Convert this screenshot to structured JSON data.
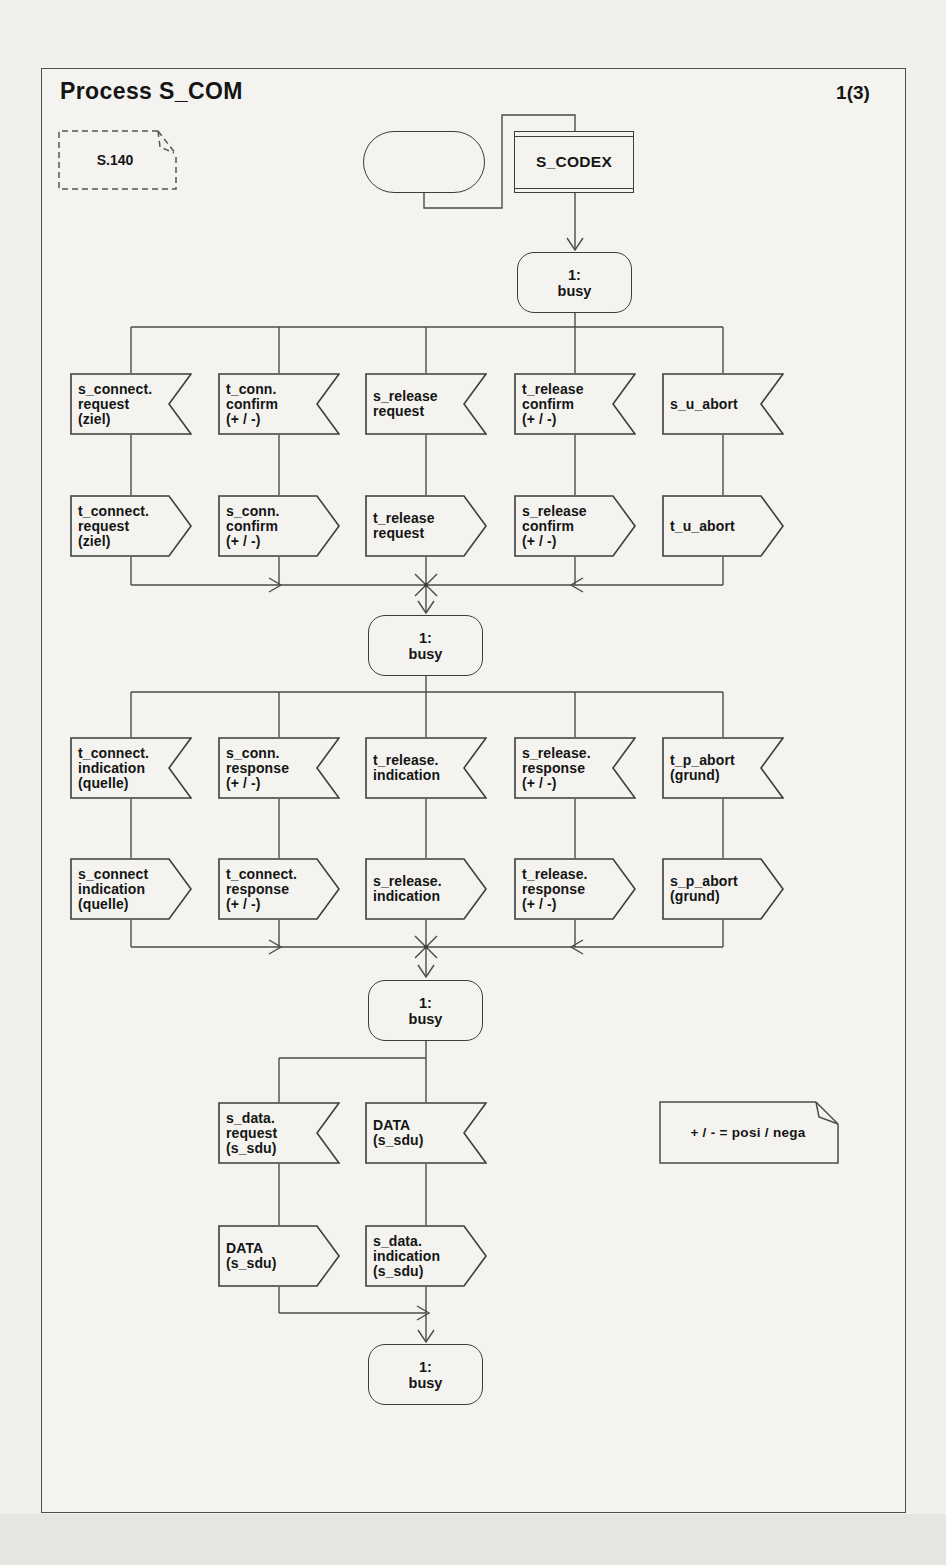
{
  "page": {
    "title": "Process S_COM",
    "page_number": "1(3)"
  },
  "comment_ref": {
    "label": "S.140"
  },
  "procedure": {
    "label": "S_CODEX"
  },
  "state": {
    "line1": "1:",
    "line2": "busy"
  },
  "note": {
    "text": "+ / - = posi / nega"
  },
  "tier1": {
    "inputs": [
      {
        "lines": [
          "s_connect.",
          "request",
          "(ziel)"
        ]
      },
      {
        "lines": [
          "t_conn.",
          "confirm",
          "(+ / -)"
        ]
      },
      {
        "lines": [
          "s_release",
          "request"
        ]
      },
      {
        "lines": [
          "t_release",
          "confirm",
          "(+ / -)"
        ]
      },
      {
        "lines": [
          "s_u_abort"
        ]
      }
    ],
    "outputs": [
      {
        "lines": [
          "t_connect.",
          "request",
          "(ziel)"
        ]
      },
      {
        "lines": [
          "s_conn.",
          "confirm",
          "(+ / -)"
        ]
      },
      {
        "lines": [
          "t_release",
          "request"
        ]
      },
      {
        "lines": [
          "s_release",
          "confirm",
          "(+ / -)"
        ]
      },
      {
        "lines": [
          "t_u_abort"
        ]
      }
    ]
  },
  "tier2": {
    "inputs": [
      {
        "lines": [
          "t_connect.",
          "indication",
          "(quelle)"
        ]
      },
      {
        "lines": [
          "s_conn.",
          "response",
          "(+ / -)"
        ]
      },
      {
        "lines": [
          "t_release.",
          "indication"
        ]
      },
      {
        "lines": [
          "s_release.",
          "response",
          "(+ / -)"
        ]
      },
      {
        "lines": [
          "t_p_abort",
          "(grund)"
        ]
      }
    ],
    "outputs": [
      {
        "lines": [
          "s_connect",
          "indication",
          "(quelle)"
        ]
      },
      {
        "lines": [
          "t_connect.",
          "response",
          "(+ / -)"
        ]
      },
      {
        "lines": [
          "s_release.",
          "indication"
        ]
      },
      {
        "lines": [
          "t_release.",
          "response",
          "(+ / -)"
        ]
      },
      {
        "lines": [
          "s_p_abort",
          "(grund)"
        ]
      }
    ]
  },
  "tier3": {
    "inputs": [
      {
        "lines": [
          "s_data.",
          "request",
          "(s_sdu)"
        ]
      },
      {
        "lines": [
          "DATA",
          "(s_sdu)"
        ]
      }
    ],
    "outputs": [
      {
        "lines": [
          "DATA",
          "(s_sdu)"
        ]
      },
      {
        "lines": [
          "s_data.",
          "indication",
          "(s_sdu)"
        ]
      }
    ]
  }
}
